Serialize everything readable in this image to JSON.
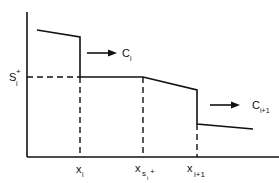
{
  "diagram": {
    "type": "piecewise step profile",
    "y_axis_label": {
      "base": "S",
      "sub": "i",
      "sup": "+"
    },
    "x_ticks": [
      {
        "base": "x",
        "sub": "i",
        "sup": ""
      },
      {
        "base": "x",
        "sub": "s",
        "subsub": "i",
        "sup": "+"
      },
      {
        "base": "x",
        "sub": "i+1",
        "sup": ""
      }
    ],
    "arrows": [
      {
        "base": "C",
        "sub": "i"
      },
      {
        "base": "C",
        "sub": "i+1"
      }
    ],
    "colors": {
      "line": "#111111",
      "background": "#ffffff"
    }
  }
}
